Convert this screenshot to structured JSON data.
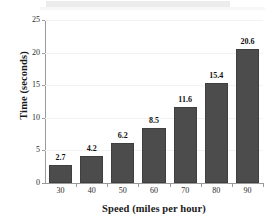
{
  "chart_data": {
    "type": "bar",
    "title": "",
    "subtitle": "",
    "xlabel": "Speed (miles per hour)",
    "ylabel": "Time (seconds)",
    "categories": [
      "30",
      "40",
      "50",
      "60",
      "70",
      "80",
      "90"
    ],
    "values": [
      2.7,
      4.2,
      6.2,
      8.5,
      11.6,
      15.4,
      20.6
    ],
    "value_labels": [
      "2.7",
      "4.2",
      "6.2",
      "8.5",
      "11.6",
      "15.4",
      "20.6"
    ],
    "ylim": [
      0,
      25
    ],
    "yticks": [
      0,
      5,
      10,
      15,
      20,
      25
    ],
    "ytick_labels": [
      "0",
      "5",
      "10",
      "15",
      "20",
      "25"
    ],
    "xlim_categories": 7,
    "grid": "horizontal-faint",
    "legend": "none",
    "bar_color": "#4c4c4c",
    "bar_edge_color": "#3f3f3f",
    "axis_color": "#9a9a9a",
    "gridline_color": "#f2f2f2",
    "text_color": "#1a1a1a",
    "background": "#ffffff",
    "banner_color": "#ececec"
  }
}
